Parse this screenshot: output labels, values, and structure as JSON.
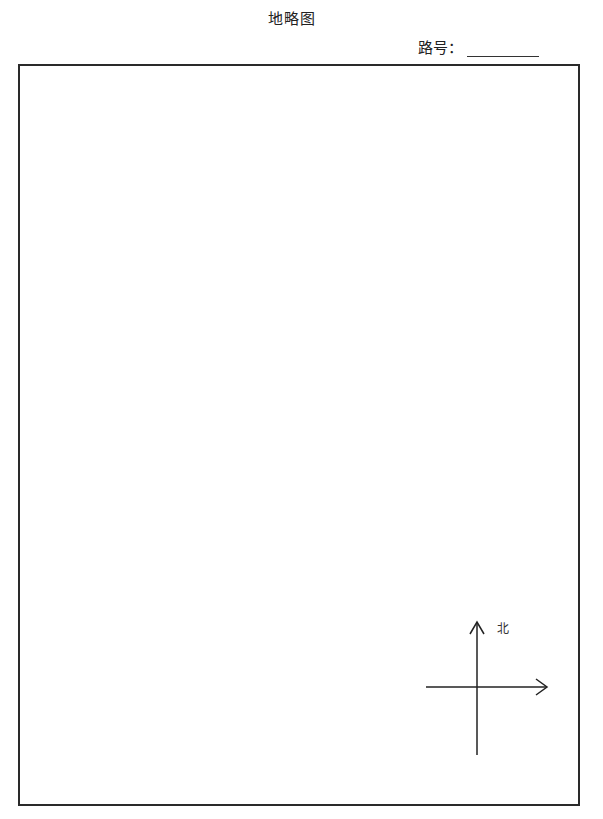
{
  "header": {
    "title": "地略图",
    "road_number_label": "路号：",
    "road_number_value": ""
  },
  "map": {
    "border_color": "#2a2a2a",
    "content": "",
    "compass": {
      "icon": "north-arrow-compass-icon",
      "north_label": "北"
    }
  }
}
